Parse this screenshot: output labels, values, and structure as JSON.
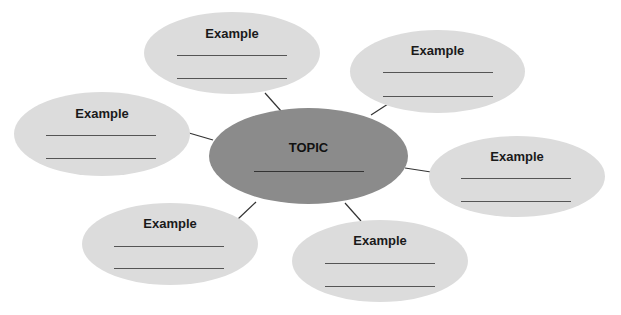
{
  "diagram": {
    "type": "bubble-map",
    "center": {
      "label": "TOPIC"
    },
    "nodes": [
      {
        "id": "top",
        "label": "Example"
      },
      {
        "id": "top-right",
        "label": "Example"
      },
      {
        "id": "left",
        "label": "Example"
      },
      {
        "id": "right",
        "label": "Example"
      },
      {
        "id": "bottom-left",
        "label": "Example"
      },
      {
        "id": "bottom-right",
        "label": "Example"
      }
    ],
    "colors": {
      "center_fill": "#8b8b8b",
      "node_fill": "#dcdcdc",
      "connector": "#333333"
    }
  }
}
